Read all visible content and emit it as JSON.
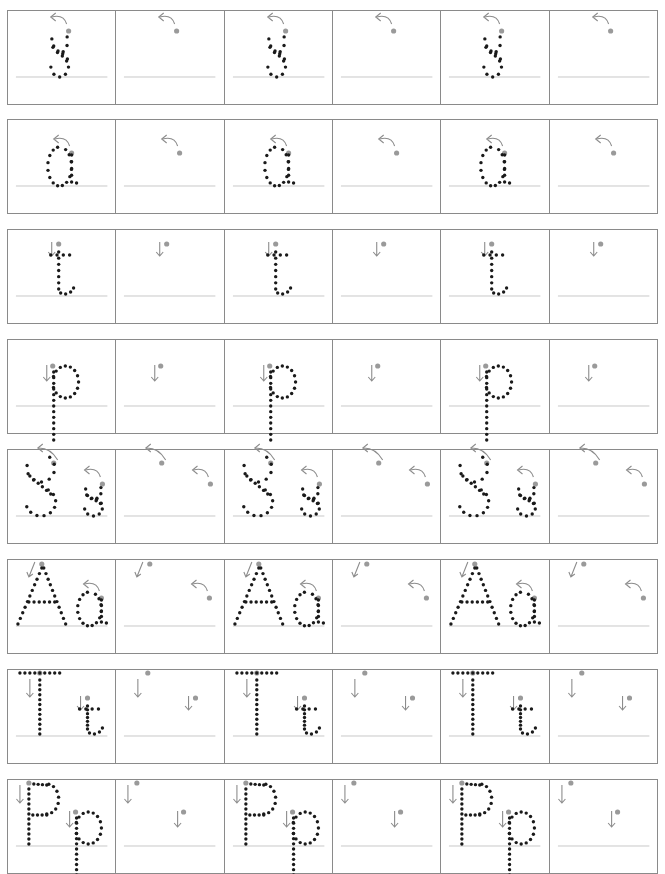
{
  "worksheet": {
    "title": "Letter tracing practice: s a t p",
    "colors": {
      "border": "#8a8a8a",
      "baseline": "#c8c8c8",
      "dot": "#1a1a1a",
      "guide": "#8c8c8c",
      "start_dot": "#9a9a9a"
    },
    "rows": [
      {
        "label": "s",
        "letters": [
          "s"
        ],
        "top": 10
      },
      {
        "label": "a",
        "letters": [
          "a"
        ],
        "top": 119
      },
      {
        "label": "t",
        "letters": [
          "t"
        ],
        "top": 229
      },
      {
        "label": "p",
        "letters": [
          "p"
        ],
        "top": 339
      },
      {
        "label": "Ss",
        "letters": [
          "S",
          "s"
        ],
        "top": 449
      },
      {
        "label": "Aa",
        "letters": [
          "A",
          "a"
        ],
        "top": 559
      },
      {
        "label": "Tt",
        "letters": [
          "T",
          "t"
        ],
        "top": 669
      },
      {
        "label": "Pp",
        "letters": [
          "P",
          "p"
        ],
        "top": 779
      }
    ],
    "cell_pattern": [
      "traced",
      "blank",
      "traced",
      "blank",
      "traced",
      "blank"
    ]
  }
}
